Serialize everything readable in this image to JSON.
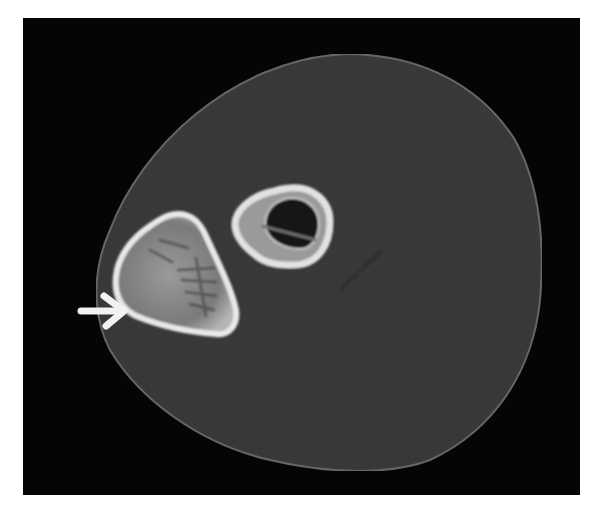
{
  "image": {
    "description": "Axial CT cross-section of a limb showing two bones within soft tissue, with a white arrow pointing at the larger bone's lateral cortex",
    "background_color": "#ffffff",
    "frame": {
      "x": 23,
      "y": 18,
      "width": 557,
      "height": 477,
      "color": "#050505"
    },
    "soft_tissue": {
      "fill": "#3b3b3b",
      "edge": "#6a6a6a",
      "path": "M 345 54 C 420 54 480 85 515 140 C 540 185 545 240 540 300 C 533 370 495 430 430 460 C 390 475 330 474 270 460 C 200 444 140 400 110 350 C 92 315 92 270 110 230 C 140 150 230 60 345 54 Z"
    },
    "large_bone": {
      "cortex_color": "#e8e8e8",
      "marrow_color": "#8e8e8e",
      "path": "M 178 214 C 192 214 200 222 206 236 C 218 262 232 290 236 310 C 238 324 230 336 216 334 C 190 332 160 326 136 316 C 120 308 114 294 116 276 C 118 256 132 238 150 226 C 160 219 168 214 178 214 Z"
    },
    "small_bone": {
      "cortex_color": "#e2e2e2",
      "cavity_color": "#121212",
      "outer_path": "M 290 188 C 312 186 330 200 330 222 C 330 245 318 264 296 265 C 276 266 262 262 254 254 C 240 244 232 230 236 218 C 240 206 254 196 270 192 C 278 190 284 188 290 188 Z",
      "inner_path": "M 292 198 C 308 198 320 210 319 226 C 318 240 310 250 298 249 C 284 248 272 242 267 232 C 263 222 266 210 276 203 C 281 200 286 198 292 198 Z"
    },
    "arrow": {
      "color": "#f2f2f2",
      "shaft": {
        "x1": 81,
        "y1": 311,
        "x2": 120,
        "y2": 311
      },
      "head": "M 104 296 L 124 311 L 106 326"
    },
    "annotations": {
      "faint_line": {
        "x1": 382,
        "y1": 250,
        "x2": 340,
        "y2": 290,
        "color": "#2a2a2a"
      }
    }
  }
}
